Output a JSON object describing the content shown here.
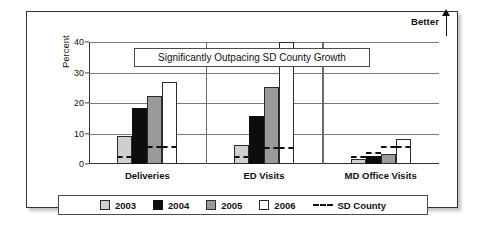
{
  "figure": {
    "callout_text": "Significantly Outpacing SD County Growth",
    "better_label": "Better",
    "better_arrow_icon": "arrow-up-icon"
  },
  "chart_data": {
    "type": "bar",
    "title": "Significantly Outpacing SD County Growth",
    "xlabel": "",
    "ylabel": "Percent",
    "ylim": [
      0,
      40
    ],
    "yticks": [
      0,
      10,
      20,
      30,
      40
    ],
    "grid": true,
    "legend_position": "bottom",
    "categories": [
      "Deliveries",
      "ED Visits",
      "MD Office Visits"
    ],
    "series": [
      {
        "name": "2003",
        "color": "#cfcfcf",
        "values": [
          9.1,
          6.3,
          1.5
        ]
      },
      {
        "name": "2004",
        "color": "#0d0d0d",
        "values": [
          18.5,
          15.8,
          2.6
        ]
      },
      {
        "name": "2005",
        "color": "#9a9a9a",
        "values": [
          22.2,
          25.2,
          3.2
        ]
      },
      {
        "name": "2006",
        "color": "#ffffff",
        "values": [
          27.0,
          41.5,
          8.2
        ]
      }
    ],
    "benchmark": {
      "name": "SD County",
      "style": "dashed",
      "color": "#111111",
      "values": [
        [
          2.1,
          3.2,
          5.2,
          5.2
        ],
        [
          2.1,
          3.6,
          5.0,
          5.0
        ],
        [
          2.1,
          3.4,
          5.3,
          5.3
        ]
      ]
    },
    "annotations": [
      {
        "text": "Better",
        "position": "top-right",
        "icon": "arrow-up-icon"
      }
    ]
  },
  "legend": {
    "items": [
      {
        "label": "2003",
        "swatch": "y2003"
      },
      {
        "label": "2004",
        "swatch": "y2004"
      },
      {
        "label": "2005",
        "swatch": "y2005"
      },
      {
        "label": "2006",
        "swatch": "y2006"
      },
      {
        "label": "SD County",
        "swatch": "dash"
      }
    ]
  }
}
